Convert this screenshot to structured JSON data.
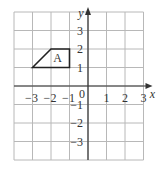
{
  "diagram": {
    "type": "coordinate-grid",
    "x_range": [
      -4,
      3
    ],
    "y_range": [
      -4,
      4
    ],
    "origin_label": "0",
    "x_axis_label": "x",
    "y_axis_label": "y",
    "x_tick_labels": [
      "−3",
      "−2",
      "−1",
      "1",
      "2",
      "3"
    ],
    "x_tick_values": [
      -3,
      -2,
      -1,
      1,
      2,
      3
    ],
    "y_tick_labels": [
      "3",
      "2",
      "1",
      "−1",
      "−2",
      "−3"
    ],
    "y_tick_values": [
      3,
      2,
      1,
      -1,
      -2,
      -3
    ],
    "shape": {
      "label": "A",
      "vertices": [
        [
          -3,
          1
        ],
        [
          -2,
          2
        ],
        [
          -1,
          2
        ],
        [
          -1,
          1
        ]
      ],
      "label_position": [
        -1.65,
        1.5
      ]
    },
    "colors": {
      "grid": "#b8b8b8",
      "axis": "#333333",
      "shape": "#222222",
      "text": "#333333"
    }
  }
}
